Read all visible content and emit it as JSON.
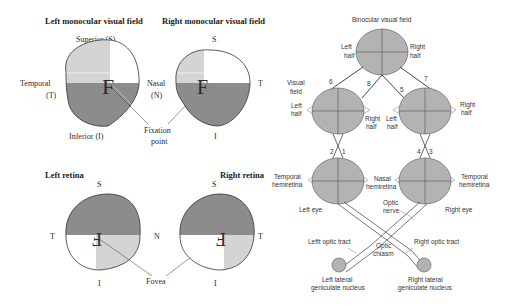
{
  "left_panel": {
    "top": {
      "left_title": "Left monocular visual field",
      "right_title": "Right monocular visual field",
      "superior_label": "Superior (S)",
      "temporal_label_line1": "Temporal",
      "temporal_label_line2": "(T)",
      "nasal_label_line1": "Nasal",
      "nasal_label_line2": "(N)",
      "inferior_label": "Inferior (I)",
      "right_s": "S",
      "right_t": "T",
      "right_i": "I",
      "fixation_line1": "Fixation",
      "fixation_line2": "point",
      "letter": "F"
    },
    "bottom": {
      "left_title": "Left retina",
      "right_title": "Right retina",
      "left_s": "S",
      "left_t": "T",
      "left_i": "I",
      "n_label": "N",
      "right_s": "S",
      "right_t": "T",
      "right_i": "I",
      "fovea": "Fovea",
      "letter": "F"
    }
  },
  "right_panel": {
    "binocular_title": "Binocular visual field",
    "bin_left_half_1": "Left",
    "bin_left_half_2": "half",
    "bin_right_half_1": "Right",
    "bin_right_half_2": "half",
    "visual_field_1": "Visual",
    "visual_field_2": "field",
    "num6": "6",
    "num8": "8",
    "num5": "5",
    "num7": "7",
    "lf_left_1": "Left",
    "lf_left_2": "half",
    "lf_right_1": "Right",
    "lf_right_2": "half",
    "rf_left_1": "Left",
    "rf_left_2": "half",
    "rf_right_1": "Right",
    "rf_right_2": "half",
    "num2": "2",
    "num1": "1",
    "num4": "4",
    "num3": "3",
    "temp_hemi_l_1": "Temporal",
    "temp_hemi_l_2": "hemiretina",
    "nasal_hemi_1": "Nasal",
    "nasal_hemi_2": "hemiretina",
    "temp_hemi_r_1": "Temporal",
    "temp_hemi_r_2": "hemiretina",
    "left_eye": "Left eye",
    "right_eye": "Right eye",
    "optic_nerve_1": "Optic",
    "optic_nerve_2": "nerve",
    "left_optic_tract": "Leftt optic tract",
    "right_optic_tract": "Right optic tract",
    "optic_chiasm_1": "Optic",
    "optic_chiasm_2": "chiasm",
    "left_lgn_1": "Left lateral",
    "left_lgn_2": "geniculate nucleus",
    "right_lgn_1": "Right lateral",
    "right_lgn_2": "geniculate nucleus"
  },
  "colors": {
    "dark_gray": "#8c8c8c",
    "light_gray": "#d4d4d4",
    "circle_fill": "#b3b3b3"
  }
}
